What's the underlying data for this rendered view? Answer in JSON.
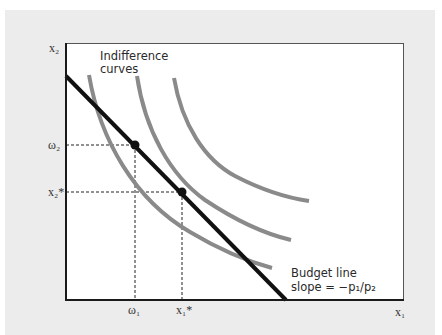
{
  "diagram": {
    "annotations": {
      "indifference_line1": "Indifference",
      "indifference_line2": "curves",
      "budget_line1": "Budget line",
      "budget_line2": "slope = −p₁/p₂"
    },
    "axes": {
      "x_label": "x₁",
      "y_label": "x₂"
    },
    "ticks": {
      "x": [
        "ω₁",
        "x₁*"
      ],
      "y": [
        "ω₂",
        "x₂*"
      ]
    },
    "points": [
      {
        "name": "endowment",
        "label": "(ω₁, ω₂)"
      },
      {
        "name": "optimal-choice",
        "label": "(x₁*, x₂*)"
      }
    ],
    "colors": {
      "background": "#ececec",
      "plot": "#ffffff",
      "budget_line": "#111111",
      "indifference_curves": "#8a8a8a",
      "axes": "#1a1a1a"
    }
  }
}
